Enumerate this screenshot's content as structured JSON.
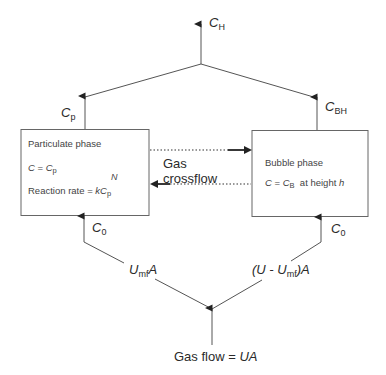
{
  "diagram": {
    "top_output": {
      "symbol": "C",
      "sub": "H"
    },
    "left_top_flow": {
      "symbol": "C",
      "sub": "p"
    },
    "right_top_flow": {
      "symbol": "C",
      "sub": "BH"
    },
    "particulate_box": {
      "title": "Particulate phase",
      "line2_c": "C",
      "line2_eq": " = ",
      "line2_cp": "C",
      "line2_cp_sub": "p",
      "line3_text": "Reaction rate = ",
      "line3_k": "kC",
      "line3_sub": "p",
      "line3_exp": "N"
    },
    "bubble_box": {
      "title": "Bubble phase",
      "line2_c": "C",
      "line2_eq": " = ",
      "line2_cb": "C",
      "line2_cb_sub": "B",
      "line2_rest": "  at height ",
      "line2_h": "h"
    },
    "crossflow": {
      "line1": "Gas",
      "line2": "crossflow"
    },
    "left_inlet": {
      "symbol": "C",
      "sub": "0"
    },
    "right_inlet": {
      "symbol": "C",
      "sub": "0"
    },
    "left_split": {
      "pre": "U",
      "sub": "mf",
      "post": "A"
    },
    "right_split": {
      "pre": "(U - U",
      "sub": "mf",
      "post": ")A"
    },
    "bottom_input": {
      "text": "Gas flow = ",
      "var": "UA"
    },
    "colors": {
      "line": "#555555",
      "box": "#666666",
      "arrow": "#222222"
    }
  }
}
